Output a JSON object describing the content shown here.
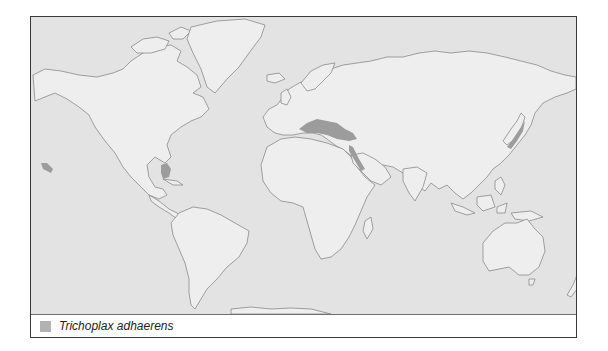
{
  "map": {
    "title": "World distribution map",
    "colors": {
      "sea": "#e3e3e3",
      "land": "#eeeeee",
      "coast": "#8a8a8a",
      "range": "#9c9c9c",
      "frame": "#3a3a3a"
    },
    "highlighted_regions": [
      "Mediterranean Sea",
      "Red Sea",
      "Gulf of Mexico / Caribbean (Florida)",
      "Hawaii",
      "Japan (Pacific coast)"
    ]
  },
  "legend": {
    "items": [
      {
        "label": "Trichoplax adhaerens",
        "swatch_color": "#b2b2b2"
      }
    ]
  }
}
